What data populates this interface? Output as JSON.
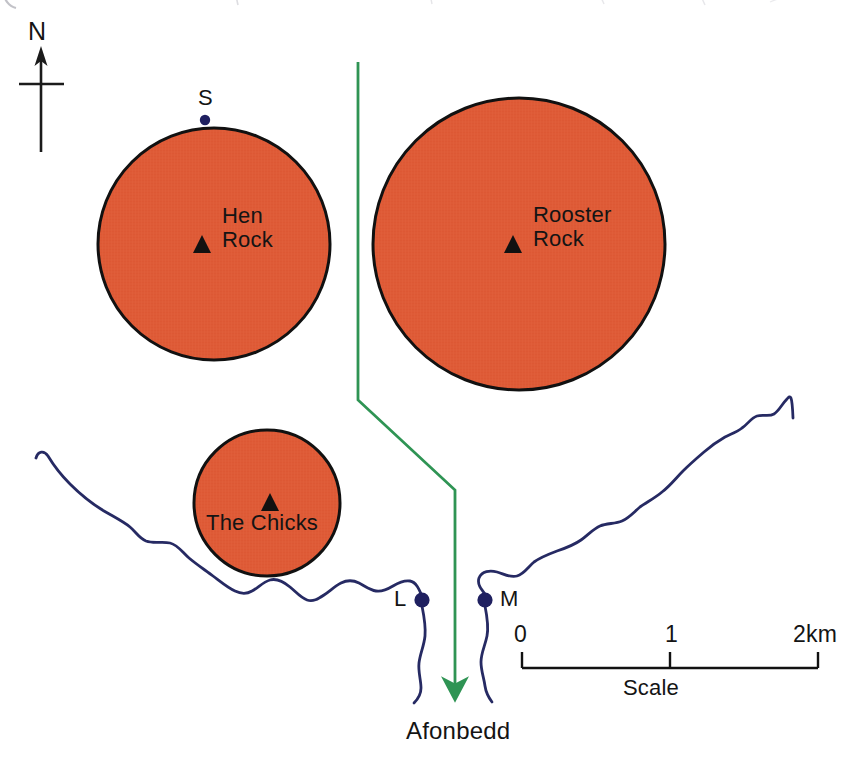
{
  "map": {
    "title": "Hen Rock and Rooster Rock island map",
    "background_color": "#ffffff",
    "rock_fill_color": "#DE5B37",
    "rock_outline_color": "#111111",
    "river_color": "#262a63",
    "route_color": "#2f9454",
    "text_color": "#141414"
  },
  "north_arrow": {
    "label": "N"
  },
  "rocks": [
    {
      "name": "hen-rock",
      "label_line1": "Hen",
      "label_line2": "Rock",
      "cx": 214,
      "cy": 244,
      "r": 116,
      "marker_x": 202,
      "marker_y": 245,
      "label_x": 222,
      "label_y": 215
    },
    {
      "name": "rooster-rock",
      "label_line1": "Rooster",
      "label_line2": "Rock",
      "cx": 519,
      "cy": 244,
      "r": 146,
      "marker_x": 513,
      "marker_y": 245,
      "label_x": 533,
      "label_y": 214
    },
    {
      "name": "the-chicks",
      "label_line1": "The Chicks",
      "label_line2": "",
      "cx": 267,
      "cy": 503,
      "r": 73,
      "marker_x": 270,
      "marker_y": 504,
      "label_x": 209,
      "label_y": 513
    }
  ],
  "points": [
    {
      "id": "S",
      "label": "S",
      "dot_x": 205,
      "dot_y": 120,
      "label_x": 199,
      "label_y": 88
    },
    {
      "id": "L",
      "label": "L",
      "dot_x": 422,
      "dot_y": 600,
      "label_x": 394,
      "label_y": 588
    },
    {
      "id": "M",
      "label": "M",
      "dot_x": 485,
      "dot_y": 600,
      "label_x": 499,
      "label_y": 588
    }
  ],
  "route": {
    "name": "Afonbedd",
    "arrow_label": "Afonbedd",
    "label_x": 408,
    "label_y": 718
  },
  "scale_bar": {
    "left_label": "0",
    "mid_label": "1",
    "right_label": "2km",
    "caption": "Scale",
    "x_start": 522,
    "x_mid": 670,
    "x_end": 818,
    "bar_y": 668,
    "label_y": 624,
    "caption_x": 627,
    "caption_y": 678
  }
}
